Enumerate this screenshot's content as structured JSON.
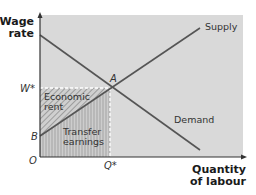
{
  "diagram": {
    "y_axis_title_line1": "Wage",
    "y_axis_title_line2": "rate",
    "x_axis_title_line1": "Quantity",
    "x_axis_title_line2": "of labour",
    "origin_label": "O",
    "wage_label": "W*",
    "quantity_label": "Q*",
    "intercept_label": "B",
    "equilibrium_label": "A",
    "supply_label": "Supply",
    "demand_label": "Demand",
    "economic_rent_line1": "Economic",
    "economic_rent_line2": "rent",
    "transfer_earnings_line1": "Transfer",
    "transfer_earnings_line2": "earnings",
    "colors": {
      "background": "#d9d9d9",
      "lines": "#555555",
      "dashed": "#ffffff",
      "economic_rent_hatch": "#9a9a9a",
      "transfer_earnings_hatch": "#a8a8a8"
    }
  }
}
